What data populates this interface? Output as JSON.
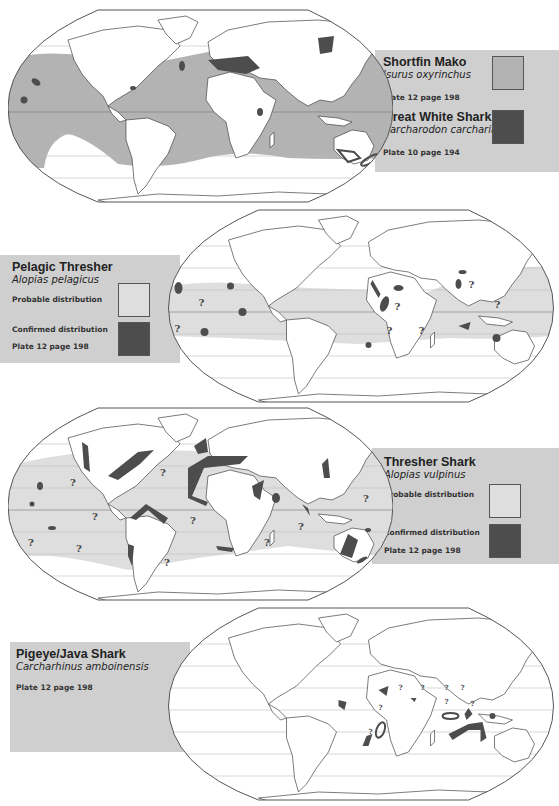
{
  "panels": [
    {
      "id": "shortfin-mako-great-white",
      "species": [
        {
          "common_name": "Shortfin Mako",
          "scientific_name": "Isurus oxyrinchus",
          "reference": "Plate 12 page 198",
          "swatch_color": "#b3b3b3"
        },
        {
          "common_name": "Great White Shark",
          "scientific_name": "Carcharodon carcharias",
          "reference": "Plate 10 page 194",
          "swatch_color": "#4d4d4d"
        }
      ]
    },
    {
      "id": "pelagic-thresher",
      "common_name": "Pelagic Thresher",
      "scientific_name": "Alopias pelagicus",
      "legend": [
        {
          "label": "Probable distribution",
          "color": "#dedede"
        },
        {
          "label": "Confirmed distribution",
          "color": "#4d4d4d"
        }
      ],
      "reference": "Plate 12 page 198",
      "question_mark": "?"
    },
    {
      "id": "thresher-shark",
      "common_name": "Thresher Shark",
      "scientific_name": "Alopias vulpinus",
      "legend": [
        {
          "label": "Probable distribution",
          "color": "#dedede"
        },
        {
          "label": "Confirmed distribution",
          "color": "#4d4d4d"
        }
      ],
      "reference": "Plate 12 page 198",
      "question_mark": "?"
    },
    {
      "id": "pigeye-java-shark",
      "common_name": "Pigeye/Java Shark",
      "scientific_name": "Carcharhinus amboinensis",
      "reference": "Plate 12 page 198",
      "question_mark": "?"
    }
  ],
  "colors": {
    "legend_bg": "#cfcfcf",
    "probable": "#dedede",
    "mako_range": "#b3b3b3",
    "confirmed": "#4d4d4d",
    "map_outline": "#555555",
    "graticule": "#bdbdbd"
  }
}
